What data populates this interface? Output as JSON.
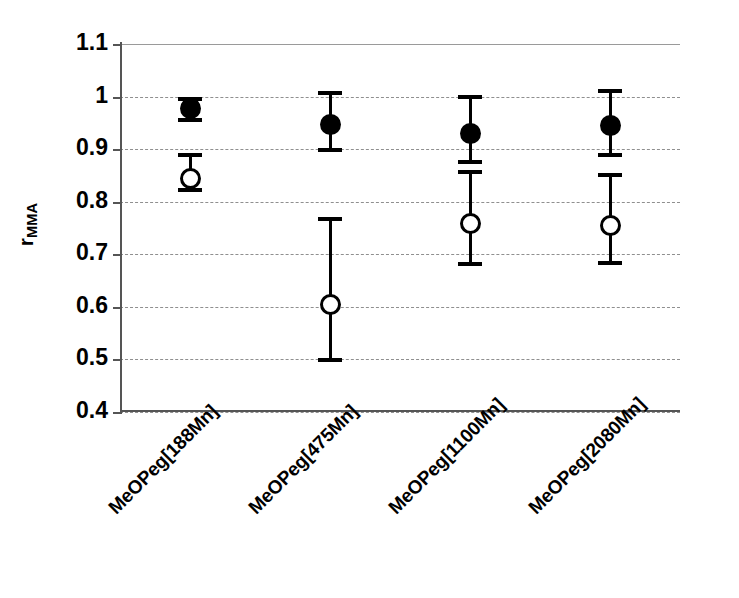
{
  "chart_data": {
    "type": "scatter",
    "title": "",
    "xlabel": "",
    "ylabel": "r_MMA",
    "ylabel_base": "r",
    "ylabel_sub": "MMA",
    "ylim": [
      0.4,
      1.1
    ],
    "yticks": [
      1.1,
      1,
      0.9,
      0.8,
      0.7,
      0.6,
      0.5,
      0.4
    ],
    "ytick_labels": [
      "1.1",
      "1",
      "0.9",
      "0.8",
      "0.7",
      "0.6",
      "0.5",
      "0.4"
    ],
    "grid": "horizontal-dashed",
    "legend": "none",
    "categories": [
      "MeOPeg[188Mn]",
      "MeOPeg[475Mn]",
      "MeOPeg[1100Mn]",
      "MeOPeg[2080Mn]"
    ],
    "series": [
      {
        "name": "filled-circle",
        "marker": "filled circle",
        "values": [
          0.977,
          0.947,
          0.93,
          0.945
        ],
        "err_low": [
          0.951,
          0.894,
          0.872,
          0.885
        ],
        "err_high": [
          1.0,
          1.01,
          1.003,
          1.015
        ]
      },
      {
        "name": "open-circle",
        "marker": "open circle",
        "values": [
          0.845,
          0.605,
          0.758,
          0.755
        ],
        "err_low": [
          0.818,
          0.495,
          0.678,
          0.68
        ],
        "err_high": [
          0.893,
          0.77,
          0.86,
          0.855
        ]
      }
    ]
  }
}
